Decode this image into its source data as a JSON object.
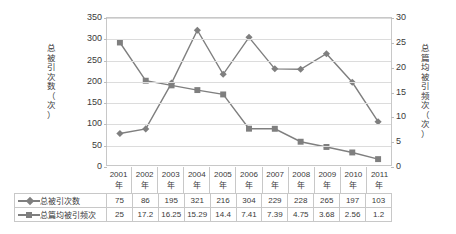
{
  "chart_data": {
    "type": "line",
    "title": "",
    "xlabel": "",
    "categories": [
      "2001年",
      "2002年",
      "2003年",
      "2004年",
      "2005年",
      "2006年",
      "2007年",
      "2008年",
      "2009年",
      "2010年",
      "2011年"
    ],
    "category_lines": [
      [
        "2001",
        "年"
      ],
      [
        "2002",
        "年"
      ],
      [
        "2003",
        "年"
      ],
      [
        "2004",
        "年"
      ],
      [
        "2005",
        "年"
      ],
      [
        "2006",
        "年"
      ],
      [
        "2007",
        "年"
      ],
      [
        "2008",
        "年"
      ],
      [
        "2009",
        "年"
      ],
      [
        "2010",
        "年"
      ],
      [
        "2011",
        "年"
      ]
    ],
    "series": [
      {
        "name": "总被引次数",
        "axis": "left",
        "marker": "diamond",
        "color": "#7f7f7f",
        "values": [
          75,
          86,
          195,
          321,
          216,
          304,
          229,
          228,
          265,
          197,
          103
        ]
      },
      {
        "name": "总篇均被引频次",
        "axis": "right",
        "marker": "square",
        "color": "#7f7f7f",
        "values": [
          25,
          17.2,
          16.25,
          15.29,
          14.4,
          7.41,
          7.39,
          4.75,
          3.68,
          2.56,
          1.2
        ]
      }
    ],
    "left_axis": {
      "title": "总被引次数（次）",
      "title_chars": [
        "总",
        "被",
        "引",
        "次",
        "数",
        "（",
        "次",
        "）"
      ],
      "ylim": [
        0,
        350
      ],
      "ticks": [
        0,
        50,
        100,
        150,
        200,
        250,
        300,
        350
      ]
    },
    "right_axis": {
      "title": "总篇均被引频次（次）",
      "title_chars": [
        "总",
        "篇",
        "均",
        "被",
        "引",
        "频",
        "次",
        "（",
        "次",
        "）"
      ],
      "ylim": [
        0,
        30
      ],
      "ticks": [
        0,
        5,
        10,
        15,
        20,
        25,
        30
      ]
    },
    "grid": true,
    "legend_position": "data-table",
    "colors": {
      "series": "#7f7f7f",
      "gridline": "#dcdcdc",
      "border": "#c8c8c8",
      "text": "#3a3a3a",
      "background": "#ffffff"
    }
  }
}
